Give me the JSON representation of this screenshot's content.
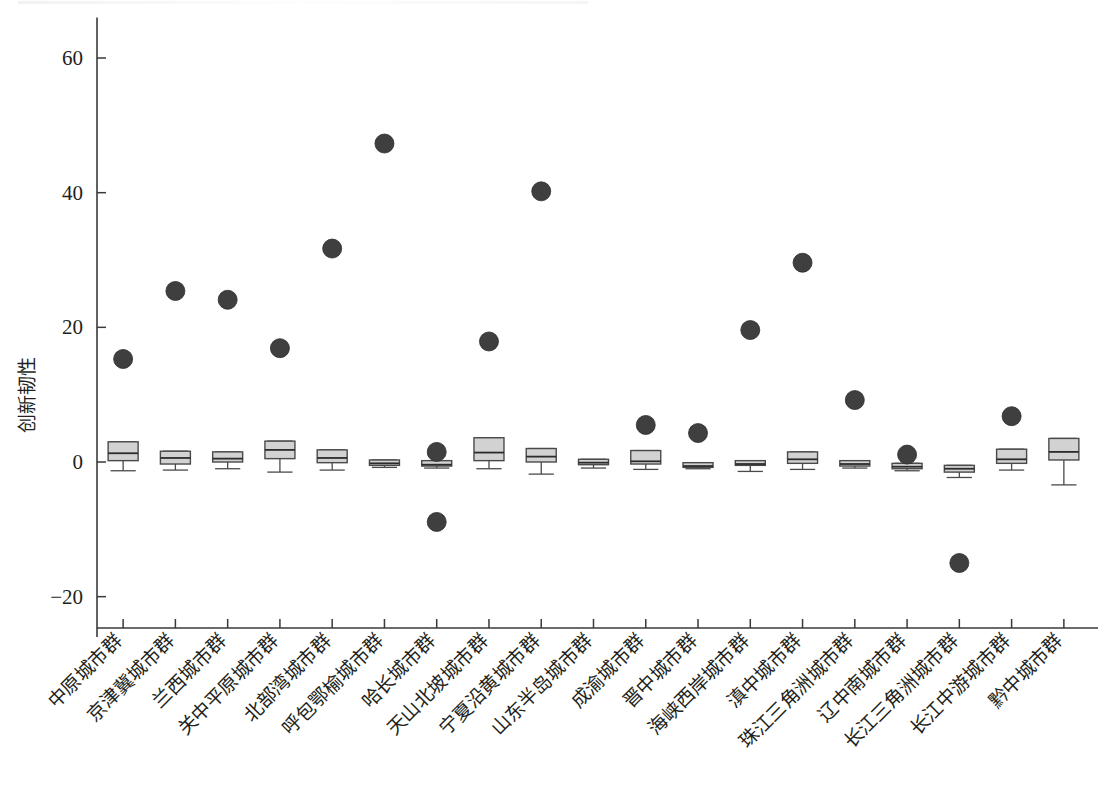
{
  "figure": {
    "background_color": "#ffffff",
    "ink_color": "#231f20",
    "box_fill_color": "#d2d2d2",
    "box_edge_color": "#4a4a4a",
    "marker_color": "#3f3f3f"
  },
  "chart_data": {
    "type": "box",
    "title": "",
    "subtitle": "",
    "xlabel": "",
    "ylabel": "创新韧性",
    "ylim": [
      -26,
      66
    ],
    "yticks": [
      -20,
      0,
      20,
      40,
      60
    ],
    "ytick_labels": [
      "−20",
      "0",
      "20",
      "40",
      "60"
    ],
    "grid": false,
    "legend": null,
    "legend_position": "none",
    "categories": [
      "中原城市群",
      "京津冀城市群",
      "兰西城市群",
      "关中平原城市群",
      "北部湾城市群",
      "呼包鄂榆城市群",
      "哈长城市群",
      "天山北坡城市群",
      "宁夏沿黄城市群",
      "山东半岛城市群",
      "成渝城市群",
      "晋中城市群",
      "海峡西岸城市群",
      "滇中城市群",
      "珠江三角洲城市群",
      "辽中南城市群",
      "长江三角洲城市群",
      "长江中游城市群",
      "黔中城市群"
    ],
    "boxes": [
      {
        "category": "中原城市群",
        "whisker_low": -1.3,
        "q1": 0.2,
        "median": 1.3,
        "q3": 3.0,
        "whisker_high": 3.0
      },
      {
        "category": "京津冀城市群",
        "whisker_low": -1.2,
        "q1": -0.3,
        "median": 0.6,
        "q3": 1.6,
        "whisker_high": 1.6
      },
      {
        "category": "兰西城市群",
        "whisker_low": -1.0,
        "q1": 0.0,
        "median": 0.5,
        "q3": 1.5,
        "whisker_high": 1.5
      },
      {
        "category": "关中平原城市群",
        "whisker_low": -1.5,
        "q1": 0.5,
        "median": 1.8,
        "q3": 3.1,
        "whisker_high": 3.1
      },
      {
        "category": "北部湾城市群",
        "whisker_low": -1.2,
        "q1": -0.1,
        "median": 0.6,
        "q3": 1.8,
        "whisker_high": 1.8
      },
      {
        "category": "呼包鄂榆城市群",
        "whisker_low": -0.8,
        "q1": -0.5,
        "median": -0.2,
        "q3": 0.3,
        "whisker_high": 0.3
      },
      {
        "category": "哈长城市群",
        "whisker_low": -0.9,
        "q1": -0.6,
        "median": -0.4,
        "q3": 0.2,
        "whisker_high": 0.2
      },
      {
        "category": "天山北坡城市群",
        "whisker_low": -1.0,
        "q1": 0.2,
        "median": 1.4,
        "q3": 3.6,
        "whisker_high": 3.6
      },
      {
        "category": "宁夏沿黄城市群",
        "whisker_low": -1.8,
        "q1": 0.0,
        "median": 0.8,
        "q3": 2.0,
        "whisker_high": 2.0
      },
      {
        "category": "山东半岛城市群",
        "whisker_low": -0.9,
        "q1": -0.4,
        "median": -0.1,
        "q3": 0.4,
        "whisker_high": 0.4
      },
      {
        "category": "成渝城市群",
        "whisker_low": -1.1,
        "q1": -0.3,
        "median": 0.1,
        "q3": 1.7,
        "whisker_high": 1.7
      },
      {
        "category": "晋中城市群",
        "whisker_low": -1.0,
        "q1": -0.8,
        "median": -0.6,
        "q3": -0.1,
        "whisker_high": -0.1
      },
      {
        "category": "海峡西岸城市群",
        "whisker_low": -1.4,
        "q1": -0.5,
        "median": -0.3,
        "q3": 0.2,
        "whisker_high": 0.2
      },
      {
        "category": "滇中城市群",
        "whisker_low": -1.1,
        "q1": -0.2,
        "median": 0.4,
        "q3": 1.5,
        "whisker_high": 1.5
      },
      {
        "category": "珠江三角洲城市群",
        "whisker_low": -0.9,
        "q1": -0.6,
        "median": -0.3,
        "q3": 0.2,
        "whisker_high": 0.2
      },
      {
        "category": "辽中南城市群",
        "whisker_low": -1.3,
        "q1": -1.0,
        "median": -0.7,
        "q3": -0.2,
        "whisker_high": -0.2
      },
      {
        "category": "长江三角洲城市群",
        "whisker_low": -2.3,
        "q1": -1.5,
        "median": -1.0,
        "q3": -0.5,
        "whisker_high": -0.5
      },
      {
        "category": "长江中游城市群",
        "whisker_low": -1.2,
        "q1": -0.2,
        "median": 0.4,
        "q3": 1.9,
        "whisker_high": 1.9
      },
      {
        "category": "黔中城市群",
        "whisker_low": -3.4,
        "q1": 0.3,
        "median": 1.5,
        "q3": 3.5,
        "whisker_high": 3.5
      }
    ],
    "outliers": [
      {
        "category": "中原城市群",
        "values": [
          15.3
        ]
      },
      {
        "category": "京津冀城市群",
        "values": [
          25.4
        ]
      },
      {
        "category": "兰西城市群",
        "values": [
          24.1
        ]
      },
      {
        "category": "关中平原城市群",
        "values": [
          16.9
        ]
      },
      {
        "category": "北部湾城市群",
        "values": [
          31.7
        ]
      },
      {
        "category": "呼包鄂榆城市群",
        "values": [
          47.3
        ]
      },
      {
        "category": "哈长城市群",
        "values": [
          1.5,
          -8.9
        ]
      },
      {
        "category": "天山北坡城市群",
        "values": [
          17.9
        ]
      },
      {
        "category": "宁夏沿黄城市群",
        "values": [
          40.2
        ]
      },
      {
        "category": "山东半岛城市群",
        "values": []
      },
      {
        "category": "成渝城市群",
        "values": [
          5.5
        ]
      },
      {
        "category": "晋中城市群",
        "values": [
          4.3
        ]
      },
      {
        "category": "海峡西岸城市群",
        "values": [
          19.6
        ]
      },
      {
        "category": "滇中城市群",
        "values": [
          29.6
        ]
      },
      {
        "category": "珠江三角洲城市群",
        "values": [
          9.2
        ]
      },
      {
        "category": "辽中南城市群",
        "values": [
          1.1
        ]
      },
      {
        "category": "长江三角洲城市群",
        "values": [
          -15.0
        ]
      },
      {
        "category": "长江中游城市群",
        "values": [
          6.8
        ]
      },
      {
        "category": "黔中城市群",
        "values": []
      }
    ]
  }
}
